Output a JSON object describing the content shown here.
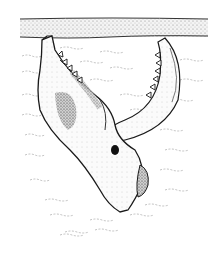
{
  "illustration": {
    "subject": "jaw bone embedded in sediment",
    "style": "pen-and-ink stipple drawing",
    "colors": {
      "background": "#ffffff",
      "ink": "#1a1a1a",
      "stipple_band": "#bdbdbd",
      "water_lines": "#9a9a9a"
    },
    "regions": {
      "top_band": "stippled sediment surface layer",
      "water": "wavy dashed lines representing matrix/water",
      "upper_jaw": "skull/upper jaw with teeth, left",
      "lower_jaw": "mandible with teeth, right",
      "base": "rounded condyle at bottom"
    }
  }
}
